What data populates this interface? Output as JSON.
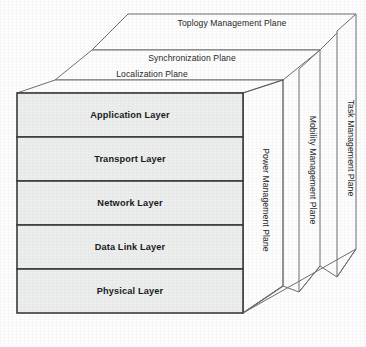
{
  "diagram": {
    "background_color": "#fdfdfd",
    "front_face_fill": "#eceded",
    "stroke_color": "#3a3a3a",
    "stack_layers": [
      {
        "id": "application",
        "label": "Application Layer"
      },
      {
        "id": "transport",
        "label": "Transport Layer"
      },
      {
        "id": "network",
        "label": "Network Layer"
      },
      {
        "id": "datalink",
        "label": "Data Link Layer"
      },
      {
        "id": "physical",
        "label": "Physical Layer"
      }
    ],
    "top_planes": [
      {
        "id": "topology",
        "label": "Toplogy Management Plane"
      },
      {
        "id": "synchronization",
        "label": "Synchronization Plane"
      },
      {
        "id": "localization",
        "label": "Localization Plane"
      }
    ],
    "side_planes": [
      {
        "id": "power",
        "label": "Power Management Plane"
      },
      {
        "id": "mobility",
        "label": "Mobility Management Plane"
      },
      {
        "id": "task",
        "label": "Task Management Plane"
      }
    ]
  }
}
